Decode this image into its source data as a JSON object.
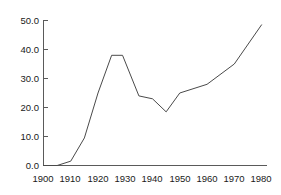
{
  "chart_data": {
    "type": "line",
    "title": "",
    "subtitle": "",
    "xlabel": "",
    "ylabel": "",
    "xlim": [
      1900,
      1982
    ],
    "ylim": [
      0,
      50
    ],
    "grid": false,
    "legend": false,
    "legend_position": "none",
    "line_color": "#4a4a4a",
    "axis_color": "#5a5a5a",
    "background_color": "#ffffff",
    "x_ticks": [
      1900,
      1910,
      1920,
      1930,
      1940,
      1950,
      1960,
      1970,
      1980
    ],
    "x_tick_labels": [
      "1900",
      "1910",
      "1920",
      "1930",
      "1940",
      "1950",
      "1960",
      "1970",
      "1980"
    ],
    "y_ticks": [
      0,
      10,
      20,
      30,
      40,
      50
    ],
    "y_tick_labels": [
      "0.0",
      "10.0",
      "20.0",
      "30.0",
      "40.0",
      "50.0"
    ],
    "series": [
      {
        "name": "series-1",
        "x": [
          1900,
          1905,
          1910,
          1915,
          1920,
          1925,
          1929,
          1935,
          1940,
          1945,
          1950,
          1960,
          1970,
          1980
        ],
        "values": [
          0.0,
          0.0,
          1.5,
          9.5,
          25.0,
          38.0,
          38.0,
          24.0,
          23.0,
          18.5,
          25.0,
          28.0,
          35.0,
          48.5
        ]
      }
    ]
  }
}
